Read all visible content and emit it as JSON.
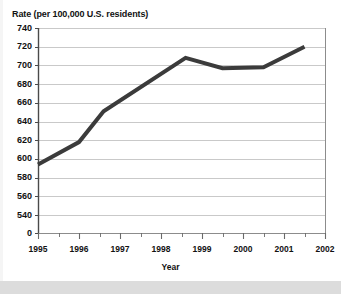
{
  "chart_data": {
    "type": "line",
    "title": "Rate (per 100,000 U.S. residents)",
    "xlabel": "Year",
    "ylabel": "Rate (per 100,000 U.S. residents)",
    "ylim": [
      530,
      740
    ],
    "ytick_labels": [
      "740",
      "720",
      "700",
      "680",
      "660",
      "640",
      "620",
      "600",
      "580",
      "560",
      "540",
      "0"
    ],
    "ytick_values": [
      740,
      720,
      700,
      680,
      660,
      640,
      620,
      600,
      580,
      560,
      540,
      530
    ],
    "axis_break": true,
    "xlim": [
      1995,
      2002
    ],
    "xtick_labels": [
      "1995",
      "1996",
      "1997",
      "1998",
      "1999",
      "2000",
      "2001",
      "2002"
    ],
    "xtick_values": [
      1995,
      1996,
      1997,
      1998,
      1999,
      2000,
      2001,
      2002
    ],
    "minor_xticks": true,
    "grid": "horizontal",
    "legend": "none",
    "line_color": "#3b3b3b",
    "line_width": 4,
    "x": [
      1995.0,
      1996.0,
      1996.6,
      1998.6,
      1999.5,
      2000.5,
      2001.5
    ],
    "values": [
      594,
      618,
      651,
      708,
      697,
      698,
      720
    ],
    "series": [
      {
        "name": "Rate per 100,000 U.S. residents",
        "points": [
          {
            "x": 1995.0,
            "y": 594
          },
          {
            "x": 1996.0,
            "y": 618
          },
          {
            "x": 1996.6,
            "y": 651
          },
          {
            "x": 1998.6,
            "y": 708
          },
          {
            "x": 1999.5,
            "y": 697
          },
          {
            "x": 2000.5,
            "y": 698
          },
          {
            "x": 2001.5,
            "y": 720
          }
        ]
      }
    ]
  }
}
